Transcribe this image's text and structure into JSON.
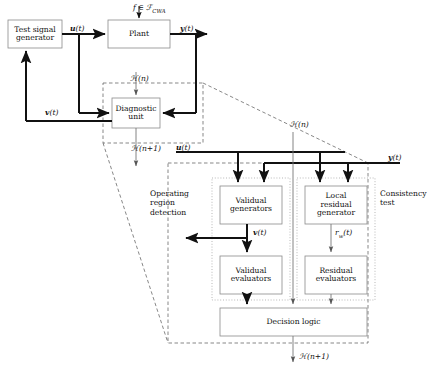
{
  "diagram": {
    "blocks": [
      {
        "id": "test-signal-generator",
        "label": "Test signal\ngenerator",
        "x": 8,
        "y": 20,
        "w": 54,
        "h": 28
      },
      {
        "id": "plant",
        "label": "Plant",
        "x": 108,
        "y": 20,
        "w": 62,
        "h": 28
      },
      {
        "id": "diagnostic-unit",
        "label": "Diagnostic\nunit",
        "x": 112,
        "y": 98,
        "w": 48,
        "h": 30
      },
      {
        "id": "validual-generators",
        "label": "Validual\ngenerators",
        "x": 220,
        "y": 186,
        "w": 62,
        "h": 38
      },
      {
        "id": "local-residual-generator",
        "label": "Local\nresidual\ngenerator",
        "x": 305,
        "y": 186,
        "w": 62,
        "h": 38
      },
      {
        "id": "validual-evaluators",
        "label": "Validual\nevaluators",
        "x": 220,
        "y": 256,
        "w": 62,
        "h": 38
      },
      {
        "id": "residual-evaluators",
        "label": "Residual\nevaluators",
        "x": 305,
        "y": 256,
        "w": 62,
        "h": 38
      },
      {
        "id": "decision-logic",
        "label": "Decision logic",
        "x": 220,
        "y": 308,
        "w": 147,
        "h": 28
      }
    ],
    "signals": [
      {
        "id": "fault-input",
        "text_html": "f &#8712; &#8497;<span class=\"sub\">CWA</span>",
        "plain": "f ∈ F_CWA",
        "x": 133,
        "y": 3
      },
      {
        "id": "u-top",
        "text_html": "<b>u</b>(t)",
        "plain": "u(t)",
        "x": 70,
        "y": 24
      },
      {
        "id": "y-top",
        "text_html": "<b>y</b>(t)",
        "plain": "y(t)",
        "x": 180,
        "y": 24
      },
      {
        "id": "hn-diagnostic",
        "text_html": "&#8459;(n)",
        "plain": "H(n)",
        "x": 130,
        "y": 74
      },
      {
        "id": "v-left",
        "text_html": "<b>v</b>(t)",
        "plain": "v(t)",
        "x": 45,
        "y": 108
      },
      {
        "id": "hn1-diagnostic",
        "text_html": "&#8459;(n+1)",
        "plain": "H(n+1)",
        "x": 131,
        "y": 144
      },
      {
        "id": "hn-consistency",
        "text_html": "&#8459;(n)",
        "plain": "H(n)",
        "x": 290,
        "y": 120
      },
      {
        "id": "u-lower",
        "text_html": "<b>u</b>(t)",
        "plain": "u(t)",
        "x": 176,
        "y": 143
      },
      {
        "id": "y-lower",
        "text_html": "<b>y</b>(t)",
        "plain": "y(t)",
        "x": 388,
        "y": 157
      },
      {
        "id": "v-lower",
        "text_html": "<b>v</b>(t)",
        "plain": "v(t)",
        "x": 253,
        "y": 228
      },
      {
        "id": "rw-lower",
        "text_html": "r<span class=\"sub\">w</span>(t)",
        "plain": "r_w(t)",
        "x": 330,
        "y": 228
      },
      {
        "id": "hn1-output",
        "text_html": "&#8459;(n+1)",
        "plain": "H(n+1)",
        "x": 290,
        "y": 356
      }
    ],
    "group_labels": [
      {
        "id": "operating-region-detection",
        "label": "Operating\nregion\ndetection",
        "x": 150,
        "y": 189
      },
      {
        "id": "consistency-test",
        "label": "Consistency\ntest",
        "x": 378,
        "y": 189
      }
    ],
    "colors": {
      "stroke": "#111111",
      "box_stroke": "#8a8a8a",
      "thin_stroke": "#777777",
      "dashed": "#555555",
      "dotted": "#999999",
      "background": "#ffffff"
    }
  }
}
